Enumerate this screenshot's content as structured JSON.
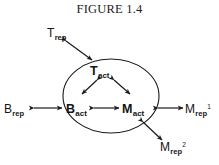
{
  "figure": {
    "title": "FIGURE 1.4",
    "background_color": "#ffffff",
    "stroke_color": "#1a1a1a"
  },
  "diagram": {
    "type": "node-link-diagram",
    "boundary_shape": "ellipse",
    "nodes": [
      {
        "id": "t-rep",
        "base": "T",
        "sub": "rep",
        "sup": "",
        "bold": false,
        "inside_ellipse": false,
        "position": "top-left-outside"
      },
      {
        "id": "t-act",
        "base": "T",
        "sub": "act",
        "sup": "",
        "bold": true,
        "inside_ellipse": true,
        "position": "top-center-inside"
      },
      {
        "id": "b-rep",
        "base": "B",
        "sub": "rep",
        "sup": "",
        "bold": false,
        "inside_ellipse": false,
        "position": "left-outside"
      },
      {
        "id": "b-act",
        "base": "B",
        "sub": "act",
        "sup": "",
        "bold": true,
        "inside_ellipse": true,
        "position": "bottom-left-inside"
      },
      {
        "id": "m-act",
        "base": "M",
        "sub": "act",
        "sup": "",
        "bold": true,
        "inside_ellipse": true,
        "position": "bottom-right-inside"
      },
      {
        "id": "m-rep-1",
        "base": "M",
        "sub": "rep",
        "sup": "1",
        "bold": false,
        "inside_ellipse": false,
        "position": "right-outside"
      },
      {
        "id": "m-rep-2",
        "base": "M",
        "sub": "rep",
        "sup": "2",
        "bold": false,
        "inside_ellipse": false,
        "position": "bottom-right-outside"
      }
    ],
    "edges": [
      {
        "id": "edge-trep-tact",
        "from": "t-rep",
        "to": "t-act",
        "style": "double-arrow",
        "orientation": "diagonal-down-right"
      },
      {
        "id": "edge-tact-bact",
        "from": "t-act",
        "to": "b-act",
        "style": "double-arrow",
        "orientation": "diagonal-down-left"
      },
      {
        "id": "edge-tact-mact",
        "from": "t-act",
        "to": "m-act",
        "style": "double-arrow",
        "orientation": "diagonal-down-right"
      },
      {
        "id": "edge-bact-mact",
        "from": "b-act",
        "to": "m-act",
        "style": "double-arrow",
        "orientation": "horizontal"
      },
      {
        "id": "edge-brep-bact",
        "from": "b-rep",
        "to": "b-act",
        "style": "double-arrow",
        "orientation": "horizontal"
      },
      {
        "id": "edge-mact-mrep1",
        "from": "m-act",
        "to": "m-rep-1",
        "style": "double-arrow",
        "orientation": "horizontal"
      },
      {
        "id": "edge-mact-mrep2",
        "from": "m-act",
        "to": "m-rep-2",
        "style": "double-arrow",
        "orientation": "diagonal-down-right"
      }
    ]
  }
}
